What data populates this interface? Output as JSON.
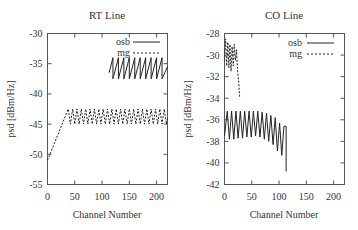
{
  "chart_data": [
    {
      "type": "line",
      "title": "RT Line",
      "xlabel": "Channel Number",
      "ylabel": "psd [dBm/Hz]",
      "xlim": [
        0,
        220
      ],
      "ylim": [
        -55,
        -30
      ],
      "xticks": [
        0,
        50,
        100,
        150,
        200
      ],
      "xtick_labels": [
        "0",
        "50",
        "100",
        "150",
        "200"
      ],
      "yticks": [
        -55,
        -50,
        -45,
        -40,
        -35,
        -30
      ],
      "ytick_labels": [
        "-55",
        "-50",
        "-45",
        "-40",
        "-35",
        "-30"
      ],
      "grid": false,
      "legend_position": "top-right",
      "series": [
        {
          "name": "osb",
          "style": "solid",
          "x": [
            113,
            120,
            120,
            130,
            130,
            140,
            140,
            150,
            150,
            160,
            160,
            170,
            170,
            180,
            180,
            190,
            190,
            200,
            200,
            210,
            210,
            220
          ],
          "y": [
            -36.5,
            -34.0,
            -37.5,
            -34.0,
            -37.5,
            -34.0,
            -37.5,
            -34.0,
            -37.5,
            -34.0,
            -37.5,
            -34.0,
            -37.5,
            -34.0,
            -37.5,
            -34.0,
            -37.5,
            -34.0,
            -37.5,
            -34.0,
            -37.5,
            -35.5
          ]
        },
        {
          "name": "mg",
          "style": "dashed",
          "x": [
            0,
            38,
            42,
            46,
            50,
            54,
            58,
            62,
            66,
            70,
            74,
            78,
            82,
            86,
            90,
            94,
            98,
            102,
            106,
            110,
            114,
            118,
            122,
            126,
            130,
            134,
            138,
            142,
            146,
            150,
            154,
            158,
            162,
            166,
            170,
            174,
            178,
            182,
            186,
            190,
            194,
            198,
            202,
            206,
            210,
            214,
            218,
            220
          ],
          "y": [
            -51,
            -42.5,
            -45.0,
            -42.5,
            -45.0,
            -42.5,
            -45.0,
            -42.5,
            -45.0,
            -42.5,
            -45.0,
            -42.5,
            -45.0,
            -42.5,
            -45.0,
            -42.5,
            -45.0,
            -42.5,
            -45.0,
            -42.5,
            -45.0,
            -42.5,
            -45.0,
            -42.5,
            -45.0,
            -42.5,
            -45.0,
            -42.5,
            -45.0,
            -42.5,
            -45.0,
            -42.5,
            -45.0,
            -42.5,
            -45.0,
            -42.5,
            -45.0,
            -42.5,
            -45.0,
            -42.5,
            -45.0,
            -42.5,
            -45.0,
            -42.5,
            -45.0,
            -42.5,
            -45.0,
            -44.0
          ]
        }
      ]
    },
    {
      "type": "line",
      "title": "CO Line",
      "xlabel": "Channel Number",
      "ylabel": "psd [dBm/Hz]",
      "xlim": [
        0,
        220
      ],
      "ylim": [
        -42,
        -28
      ],
      "xticks": [
        0,
        50,
        100,
        150,
        200
      ],
      "xtick_labels": [
        "0",
        "50",
        "100",
        "150",
        "200"
      ],
      "yticks": [
        -42,
        -40,
        -38,
        -36,
        -34,
        -32,
        -30,
        -28
      ],
      "ytick_labels": [
        "-42",
        "-40",
        "-38",
        "-36",
        "-34",
        "-32",
        "-30",
        "-28"
      ],
      "grid": false,
      "legend_position": "top-right",
      "series": [
        {
          "name": "osb",
          "style": "solid",
          "x": [
            0,
            5,
            9,
            13,
            17,
            21,
            25,
            29,
            33,
            37,
            41,
            45,
            49,
            53,
            57,
            61,
            65,
            69,
            73,
            77,
            81,
            85,
            89,
            93,
            97,
            101,
            105,
            109,
            113,
            113
          ],
          "y": [
            -37.5,
            -35.2,
            -37.8,
            -35.2,
            -37.8,
            -35.2,
            -37.7,
            -35.2,
            -37.7,
            -35.2,
            -37.6,
            -35.2,
            -37.6,
            -35.2,
            -37.5,
            -35.2,
            -37.6,
            -35.3,
            -37.8,
            -35.4,
            -38.0,
            -35.6,
            -38.3,
            -35.8,
            -38.9,
            -36.3,
            -39.3,
            -36.6,
            -36.6,
            -40.8
          ]
        },
        {
          "name": "mg",
          "style": "dashed",
          "x": [
            0,
            2,
            4,
            6,
            8,
            10,
            12,
            14,
            16,
            18,
            20,
            22,
            24,
            26,
            28
          ],
          "y": [
            -30.5,
            -28.5,
            -31.0,
            -28.8,
            -31.2,
            -29.0,
            -31.5,
            -29.2,
            -31.0,
            -29.0,
            -30.5,
            -29.5,
            -31.5,
            -32.5,
            -34.0
          ]
        }
      ]
    }
  ]
}
